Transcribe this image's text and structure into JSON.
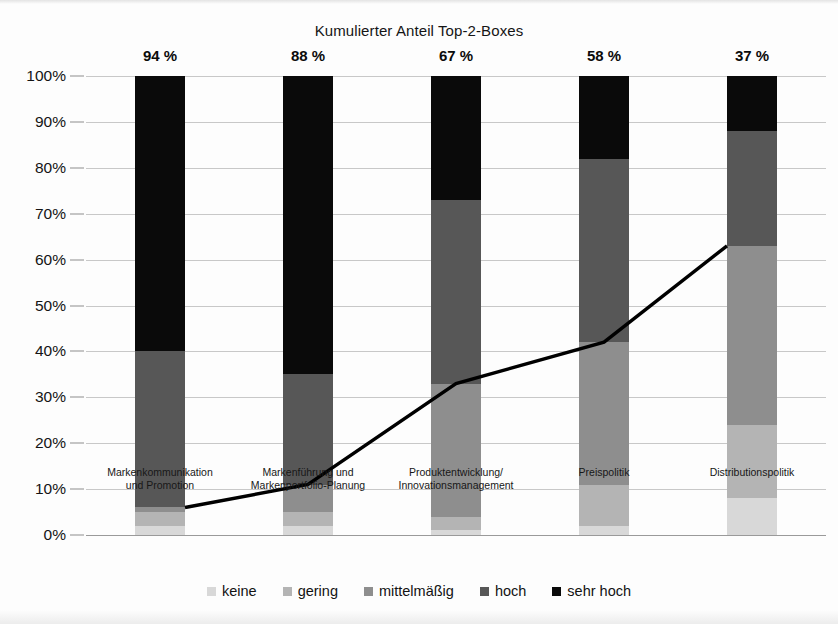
{
  "chart_data": {
    "type": "bar",
    "subtype": "stacked-bar-with-line",
    "title": "Kumulierter Anteil Top-2-Boxes",
    "xlabel": "",
    "ylabel": "",
    "ylim": [
      0,
      100
    ],
    "ytick_labels": [
      "0%",
      "10%",
      "20%",
      "30%",
      "40%",
      "50%",
      "60%",
      "70%",
      "80%",
      "90%",
      "100%"
    ],
    "ytick_values": [
      0,
      10,
      20,
      30,
      40,
      50,
      60,
      70,
      80,
      90,
      100
    ],
    "grid": true,
    "legend_position": "bottom",
    "categories": [
      "Markenkommunikation und Promotion",
      "Markenführung und Markenportfolio-Planung",
      "Produktentwicklung/ Innovationsmanagement",
      "Preispolitik",
      "Distributionspolitik"
    ],
    "category_lines": [
      [
        "Markenkommunikation",
        "und Promotion"
      ],
      [
        "Markenführung und",
        "Markenportfolio-Planung"
      ],
      [
        "Produktentwicklung/",
        "Innovationsmanagement"
      ],
      [
        "Preispolitik",
        ""
      ],
      [
        "Distributionspolitik",
        ""
      ]
    ],
    "series": [
      {
        "name": "keine",
        "color": "#d8d8d8",
        "values": [
          2,
          2,
          1,
          2,
          8
        ]
      },
      {
        "name": "gering",
        "color": "#b4b4b4",
        "values": [
          3,
          3,
          3,
          9,
          16
        ]
      },
      {
        "name": "mittelmäßig",
        "color": "#8e8e8e",
        "values": [
          1,
          6,
          29,
          31,
          39
        ]
      },
      {
        "name": "hoch",
        "color": "#575757",
        "values": [
          34,
          24,
          40,
          40,
          25
        ]
      },
      {
        "name": "sehr hoch",
        "color": "#0a0a0a",
        "values": [
          60,
          65,
          27,
          18,
          12
        ]
      }
    ],
    "bar_labels": [
      "94 %",
      "88 %",
      "67 %",
      "58 %",
      "37 %"
    ],
    "line_series": {
      "name": "Kumulierter Anteil unterer Boxen",
      "color": "#000000",
      "values": [
        6,
        11,
        33,
        42,
        63
      ]
    }
  },
  "legend": {
    "items": [
      {
        "label": "keine",
        "color": "#d8d8d8"
      },
      {
        "label": "gering",
        "color": "#b4b4b4"
      },
      {
        "label": "mittelmäßig",
        "color": "#8e8e8e"
      },
      {
        "label": "hoch",
        "color": "#575757"
      },
      {
        "label": "sehr hoch",
        "color": "#0a0a0a"
      }
    ]
  }
}
